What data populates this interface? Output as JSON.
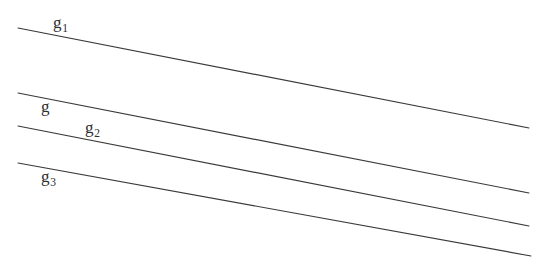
{
  "figure": {
    "type": "geometric-diagram",
    "width": 548,
    "height": 265,
    "background_color": "#ffffff",
    "line_color": "#3a3a3a",
    "label_color": "#2e2e2e"
  },
  "lines": [
    {
      "id": "line-g1",
      "x1": 18,
      "y1": 28,
      "x2": 529,
      "y2": 128,
      "label": {
        "base": "g",
        "subscript": "1",
        "x": 53,
        "y": 14
      }
    },
    {
      "id": "line-g",
      "x1": 18,
      "y1": 93,
      "x2": 529,
      "y2": 193,
      "label": {
        "base": "g",
        "subscript": "",
        "x": 41,
        "y": 98
      }
    },
    {
      "id": "line-g2",
      "x1": 18,
      "y1": 126,
      "x2": 529,
      "y2": 226,
      "label": {
        "base": "g",
        "subscript": "2",
        "x": 85,
        "y": 119
      }
    },
    {
      "id": "line-g3",
      "x1": 18,
      "y1": 163,
      "x2": 531,
      "y2": 256,
      "label": {
        "base": "g",
        "subscript": "3",
        "x": 41,
        "y": 168
      }
    }
  ]
}
